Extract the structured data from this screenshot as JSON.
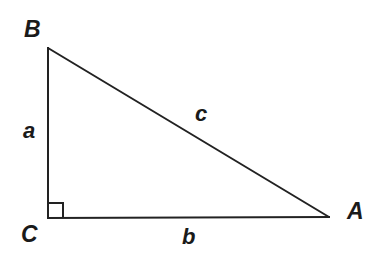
{
  "diagram": {
    "type": "right-triangle",
    "stroke_color": "#222222",
    "text_color": "#1a1a1a",
    "background": "#ffffff",
    "vertices": {
      "B": {
        "label": "B",
        "x": 48,
        "y": 48
      },
      "C": {
        "label": "C",
        "x": 48,
        "y": 218
      },
      "A": {
        "label": "A",
        "x": 329,
        "y": 217
      }
    },
    "sides": {
      "a": {
        "label": "a",
        "from": "C",
        "to": "B"
      },
      "b": {
        "label": "b",
        "from": "C",
        "to": "A"
      },
      "c": {
        "label": "c",
        "from": "B",
        "to": "A"
      }
    },
    "right_angle": {
      "at": "C",
      "size": 15
    }
  }
}
